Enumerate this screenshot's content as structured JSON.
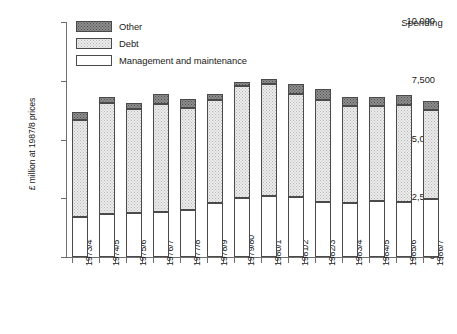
{
  "annotation": {
    "corner_label": "Spending"
  },
  "axes": {
    "ylabel": "£ million at 1987/8 prices",
    "yticks": [
      "0",
      "2,500",
      "5,000",
      "7,500",
      "10,000"
    ],
    "xlabel": ""
  },
  "legend": {
    "items": [
      {
        "label": "Other",
        "key": "other",
        "color": "#8e8e8e"
      },
      {
        "label": "Debt",
        "key": "debt",
        "color": "#ececec"
      },
      {
        "label": "Management and maintenance",
        "key": "mgmt",
        "color": "#ffffff"
      }
    ]
  },
  "chart_data": {
    "type": "bar",
    "subtype": "stacked-vertical",
    "title": "",
    "subtitle": "",
    "annotation": "Spending",
    "xlabel": "",
    "ylabel": "£ million at 1987/8 prices",
    "ylim": [
      0,
      10000
    ],
    "ytick_values": [
      0,
      2500,
      5000,
      7500,
      10000
    ],
    "ytick_labels": [
      "0",
      "2,500",
      "5,000",
      "7,500",
      "10,000"
    ],
    "grid": false,
    "legend_position": "top-left",
    "categories": [
      "1973/4",
      "1974/5",
      "1975/6",
      "1976/7",
      "1977/8",
      "1978/9",
      "1979/80",
      "1980/1",
      "1981/2",
      "1982/3",
      "1983/4",
      "1984/5",
      "1985/6",
      "1986/7"
    ],
    "series": [
      {
        "name": "Management and maintenance",
        "key": "mgmt",
        "values": [
          1700,
          1830,
          1870,
          1910,
          2000,
          2300,
          2500,
          2580,
          2550,
          2330,
          2290,
          2380,
          2330,
          2460
        ]
      },
      {
        "name": "Debt",
        "key": "debt",
        "values": [
          4150,
          4720,
          4430,
          4590,
          4330,
          4370,
          4770,
          4770,
          4380,
          4340,
          4130,
          4040,
          4130,
          3790
        ]
      },
      {
        "name": "Other",
        "key": "other",
        "values": [
          300,
          250,
          250,
          430,
          390,
          260,
          170,
          210,
          420,
          470,
          380,
          380,
          430,
          380
        ]
      }
    ],
    "totals": [
      6150,
      6800,
      6550,
      6930,
      6720,
      6930,
      7440,
      7560,
      7350,
      7140,
      6800,
      6800,
      6890,
      6630
    ]
  }
}
